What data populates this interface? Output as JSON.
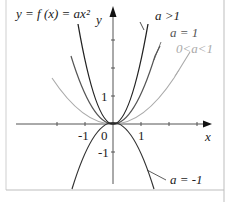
{
  "figure": {
    "title_formula": "y = f (x) = ax²",
    "x_axis_label": "x",
    "y_axis_label": "y",
    "ticks": {
      "x_neg1": "-1",
      "origin": "0",
      "x_pos1": "1",
      "y_pos1": "1",
      "y_neg1": "-1"
    },
    "curves": [
      {
        "label": "a >1",
        "a": 2,
        "color": "#222222"
      },
      {
        "label": "a = 1",
        "a": 1,
        "color": "#555555"
      },
      {
        "label": "0<a<1",
        "a": 0.5,
        "color": "#aaaaaa"
      },
      {
        "label": "a = -1",
        "a": -1,
        "color": "#333333"
      }
    ]
  }
}
